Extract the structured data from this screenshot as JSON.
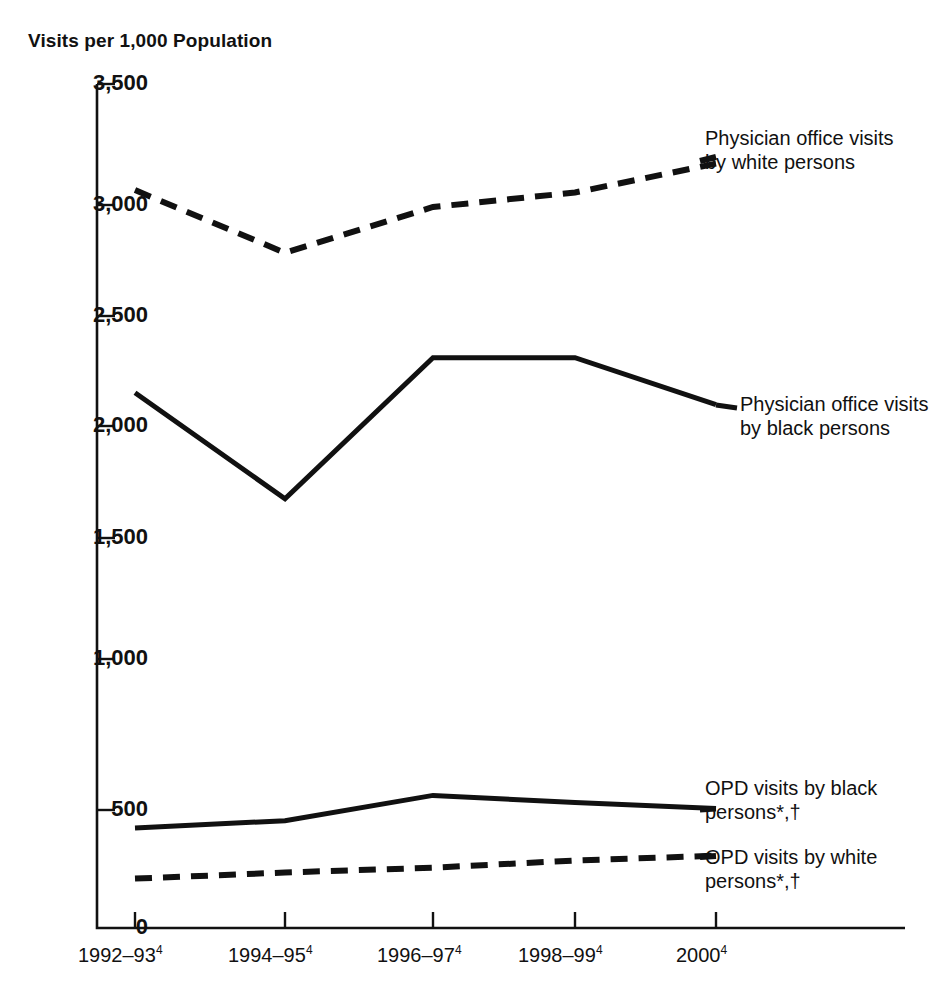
{
  "chart_data": {
    "type": "line",
    "title": "",
    "xlabel": "",
    "ylabel": "Visits per 1,000 Population",
    "ylim": [
      0,
      3500
    ],
    "ytick_values": [
      0,
      500,
      1000,
      1500,
      2000,
      2500,
      3000,
      3500
    ],
    "ytick_labels": [
      "0",
      "500",
      "1,000",
      "1,500",
      "2,000",
      "2,500",
      "3,000",
      "3,500"
    ],
    "grid": false,
    "legend_position": "inline-right-of-lines",
    "categories": [
      "1992–93",
      "1994–95",
      "1996–97",
      "1998–99",
      "2000"
    ],
    "category_footnotes": [
      "4",
      "4",
      "4",
      "4",
      "4"
    ],
    "xtick_labels": [
      {
        "text": "1992–93",
        "sup": "4"
      },
      {
        "text": "1994–95",
        "sup": "4"
      },
      {
        "text": "1996–97",
        "sup": "4"
      },
      {
        "text": "1998–99",
        "sup": "4"
      },
      {
        "text": "2000",
        "sup": "4"
      }
    ],
    "series": [
      {
        "name": "Physician office visits by white persons",
        "label_line1": "Physician office visits",
        "label_line2": "by white persons",
        "label_sup": "",
        "style": "dashed",
        "color": "#111111",
        "values": [
          3060,
          2800,
          2990,
          3050,
          3170
        ]
      },
      {
        "name": "Physician office visits by black persons",
        "label_line1": "Physician office visits",
        "label_line2": "by black persons",
        "label_sup": "",
        "style": "solid",
        "color": "#111111",
        "values": [
          2220,
          1780,
          2365,
          2365,
          2170
        ]
      },
      {
        "name": "OPD visits by black persons*,†",
        "label_line1": "OPD visits by black",
        "label_line2": "persons*,†",
        "label_sup": "*,†",
        "style": "solid",
        "color": "#111111",
        "values": [
          415,
          445,
          550,
          520,
          495
        ]
      },
      {
        "name": "OPD visits by white persons*,†",
        "label_line1": "OPD visits by white",
        "label_line2": "persons*,†",
        "label_sup": "*,†",
        "style": "dashed",
        "color": "#111111",
        "values": [
          205,
          230,
          250,
          280,
          300
        ]
      }
    ]
  },
  "axis": {
    "y_title": "Visits per 1,000 Population"
  },
  "labels": {
    "s0_line1": "Physician office visits",
    "s0_line2": "by white persons",
    "s1_line1": "Physician office visits",
    "s1_line2": "by black persons",
    "s2_line1": "OPD visits by black",
    "s2_line2": "persons*,†",
    "s3_line1": "OPD visits by white",
    "s3_line2": "persons*,†"
  },
  "yticks": {
    "t0": "3,500",
    "t1": "3,000",
    "t2": "2,500",
    "t3": "2,000",
    "t4": "1,500",
    "t5": "1,000",
    "t6": "500",
    "t7": "0"
  },
  "xticks": {
    "x0": "1992–93",
    "x0s": "4",
    "x1": "1994–95",
    "x1s": "4",
    "x2": "1996–97",
    "x2s": "4",
    "x3": "1998–99",
    "x3s": "4",
    "x4": "2000",
    "x4s": "4"
  }
}
